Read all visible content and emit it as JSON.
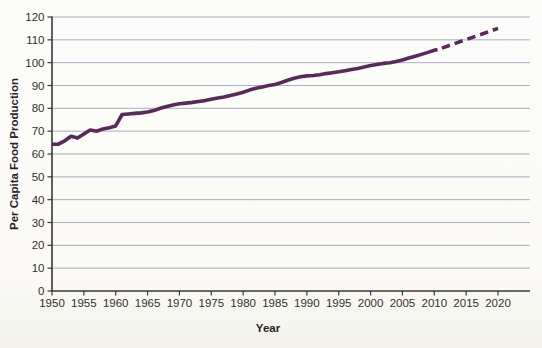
{
  "chart_data": {
    "type": "line",
    "title": "",
    "xlabel": "Year",
    "ylabel": "Per Capita Food Production",
    "xlim": [
      1950,
      2020
    ],
    "ylim": [
      0,
      120
    ],
    "x_ticks": [
      1950,
      1955,
      1960,
      1965,
      1970,
      1975,
      1980,
      1985,
      1990,
      1995,
      2000,
      2005,
      2010,
      2015,
      2020
    ],
    "y_ticks": [
      0,
      10,
      20,
      30,
      40,
      50,
      60,
      70,
      80,
      90,
      100,
      110,
      120
    ],
    "grid": "horizontal",
    "legend": "none",
    "colors": {
      "line": "#582a58",
      "grid": "#a9aec2",
      "axis": "#3c3733",
      "text": "#33302c"
    },
    "series": [
      {
        "name": "historical",
        "style": "solid",
        "points": [
          [
            1950,
            64.3
          ],
          [
            1951,
            64.3
          ],
          [
            1952,
            65.8
          ],
          [
            1953,
            67.8
          ],
          [
            1954,
            67.0
          ],
          [
            1955,
            68.8
          ],
          [
            1956,
            70.5
          ],
          [
            1957,
            70.0
          ],
          [
            1958,
            71.0
          ],
          [
            1959,
            71.5
          ],
          [
            1960,
            72.3
          ],
          [
            1961,
            77.3
          ],
          [
            1962,
            77.5
          ],
          [
            1963,
            77.8
          ],
          [
            1964,
            78.0
          ],
          [
            1965,
            78.4
          ],
          [
            1966,
            79.0
          ],
          [
            1967,
            80.0
          ],
          [
            1968,
            80.8
          ],
          [
            1969,
            81.4
          ],
          [
            1970,
            82.0
          ],
          [
            1971,
            82.3
          ],
          [
            1972,
            82.6
          ],
          [
            1973,
            83.0
          ],
          [
            1974,
            83.4
          ],
          [
            1975,
            84.0
          ],
          [
            1976,
            84.5
          ],
          [
            1977,
            85.0
          ],
          [
            1978,
            85.6
          ],
          [
            1979,
            86.3
          ],
          [
            1980,
            87.0
          ],
          [
            1981,
            88.0
          ],
          [
            1982,
            88.8
          ],
          [
            1983,
            89.4
          ],
          [
            1984,
            90.0
          ],
          [
            1985,
            90.5
          ],
          [
            1986,
            91.3
          ],
          [
            1987,
            92.3
          ],
          [
            1988,
            93.2
          ],
          [
            1989,
            93.8
          ],
          [
            1990,
            94.2
          ],
          [
            1991,
            94.4
          ],
          [
            1992,
            94.7
          ],
          [
            1993,
            95.2
          ],
          [
            1994,
            95.6
          ],
          [
            1995,
            96.0
          ],
          [
            1996,
            96.5
          ],
          [
            1997,
            97.0
          ],
          [
            1998,
            97.5
          ],
          [
            1999,
            98.1
          ],
          [
            2000,
            98.7
          ],
          [
            2001,
            99.2
          ],
          [
            2002,
            99.7
          ],
          [
            2003,
            100.0
          ],
          [
            2004,
            100.5
          ],
          [
            2005,
            101.2
          ],
          [
            2006,
            102.0
          ],
          [
            2007,
            102.8
          ],
          [
            2008,
            103.6
          ],
          [
            2009,
            104.5
          ],
          [
            2010,
            105.4
          ],
          [
            2010.5,
            105.8
          ]
        ]
      },
      {
        "name": "projected",
        "style": "dashed",
        "points": [
          [
            2011.2,
            106.4
          ],
          [
            2020,
            115.0
          ]
        ]
      }
    ]
  }
}
